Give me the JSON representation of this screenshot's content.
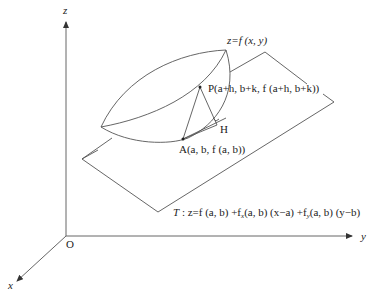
{
  "figure": {
    "axes": {
      "z_label": "z",
      "y_label": "y",
      "x_label": "x",
      "origin_label": "O"
    },
    "surface_label": "z=f (x, y)",
    "point_P_label": "P(a+h, b+k, f (a+h, b+k))",
    "point_A_label": "A(a, b, f (a, b))",
    "point_H_label": "H",
    "plane_label": "T : z=f (a, b) +fx(a, b) (x−a) +fy(a, b) (y−b)",
    "plane_name": "T",
    "plane_eq_parts": {
      "p1": " : z=f (a, b) +f",
      "sub_x": "x",
      "p2": "(a, b) (x−a) +f",
      "sub_y": "y",
      "p3": "(a, b) (y−b)"
    },
    "colors": {
      "line": "#555555",
      "axis": "#666666",
      "text": "#222222"
    }
  }
}
